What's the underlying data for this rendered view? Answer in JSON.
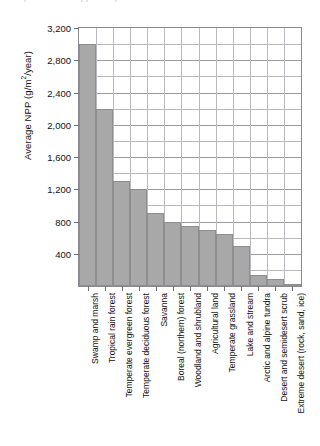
{
  "caption_sliver": "parts of a cropped caption line",
  "chart_data": {
    "type": "bar",
    "title": "",
    "xlabel": "",
    "ylabel": "Average NPP (g/m2/year)",
    "ylabel_prefix": "Average NPP (g/m",
    "ylabel_exponent": "2",
    "ylabel_suffix": "/year)",
    "ylim": [
      0,
      3200
    ],
    "ytick_labels": [
      "3,200",
      "2,800",
      "2,400",
      "2,000",
      "1,600",
      "1,200",
      "800",
      "400"
    ],
    "ytick_values": [
      3200,
      2800,
      2400,
      2000,
      1600,
      1200,
      800,
      400
    ],
    "minor_tick_step": 200,
    "grid": true,
    "legend": "none",
    "bar_color": "#a8a8a8",
    "bar_edge_color": "#8e8e8e",
    "grid_color": "#b9b9bf",
    "axis_color": "#8a8a90",
    "categories": [
      "Swamp and marsh",
      "Tropical rain forest",
      "Temperate evergreen forest",
      "Temperate deciduous forest",
      "Savanna",
      "Boreal (northern) forest",
      "Woodland and shrubland",
      "Agricultural land",
      "Temperate grassland",
      "Lake and stream",
      "Arctic and alpine tundra",
      "Desert and semidesert scrub",
      "Extreme desert (rock, sand, ice)"
    ],
    "values": [
      3000,
      2200,
      1300,
      1200,
      900,
      800,
      750,
      700,
      650,
      500,
      140,
      90,
      3
    ]
  }
}
